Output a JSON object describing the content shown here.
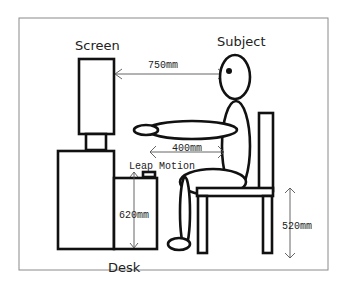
{
  "diagram": {
    "labels": {
      "screen": "Screen",
      "subject": "Subject",
      "desk": "Desk",
      "leap_motion": "Leap Motion"
    },
    "dimensions": {
      "screen_to_eye": "750mm",
      "hand_to_body": "400mm",
      "desk_height": "620mm",
      "chair_height": "520mm"
    },
    "colors": {
      "stroke": "#111111",
      "frame": "#888888",
      "background": "#ffffff"
    }
  }
}
